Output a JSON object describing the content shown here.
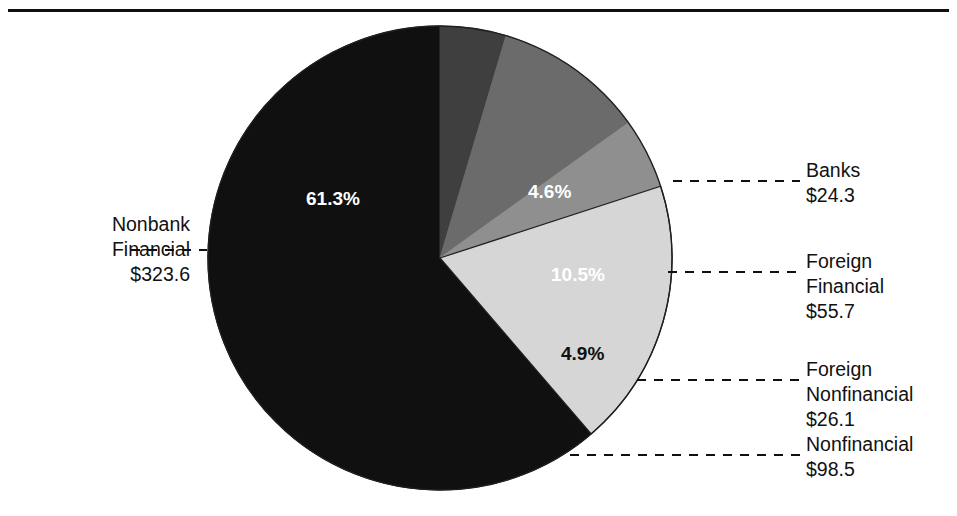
{
  "figure": {
    "has_top_rule": true,
    "background_color": "#ffffff"
  },
  "chart_data": {
    "type": "pie",
    "title": "",
    "xlabel": "",
    "ylabel": "",
    "value_unit": "$ billions",
    "legend_position": "callouts",
    "grid": false,
    "start_angle_deg": 0,
    "direction": "clockwise",
    "categories": [
      "Banks",
      "Foreign Financial",
      "Foreign Nonfinancial",
      "Nonfinancial",
      "Nonbank Financial"
    ],
    "values": [
      24.3,
      55.7,
      26.1,
      98.5,
      323.6
    ],
    "percentages": [
      4.6,
      10.5,
      4.9,
      18.7,
      61.3
    ],
    "slice_colors": [
      "#3f3f3f",
      "#6b6b6b",
      "#8f8f8f",
      "#d6d6d6",
      "#101010"
    ],
    "slice_label_colors": [
      "#ffffff",
      "#ffffff",
      "#101010",
      "#101010",
      "#ffffff"
    ],
    "percent_labels": [
      "4.6%",
      "10.5%",
      "4.9%",
      "18.7%",
      "61.3%"
    ],
    "value_labels": [
      "$24.3",
      "$55.7",
      "$26.1",
      "$98.5",
      "$323.6"
    ]
  },
  "slices": [
    {
      "name": "banks",
      "percent_label": "4.6%",
      "label_line1": "Banks",
      "label_line2": "$24.3",
      "label_line3": "",
      "color": "#3f3f3f"
    },
    {
      "name": "foreign-financial",
      "percent_label": "10.5%",
      "label_line1": "Foreign",
      "label_line2": "Financial",
      "label_line3": "$55.7",
      "color": "#6b6b6b"
    },
    {
      "name": "foreign-nonfinancial",
      "percent_label": "4.9%",
      "label_line1": "Foreign",
      "label_line2": "Nonfinancial",
      "label_line3": "$26.1",
      "color": "#8f8f8f"
    },
    {
      "name": "nonfinancial",
      "percent_label": "18.7%",
      "label_line1": "Nonfinancial",
      "label_line2": "$98.5",
      "label_line3": "",
      "color": "#d6d6d6"
    },
    {
      "name": "nonbank-financial",
      "percent_label": "61.3%",
      "label_line1": "Nonbank",
      "label_line2": "Financial",
      "label_line3": "$323.6",
      "color": "#101010"
    }
  ]
}
